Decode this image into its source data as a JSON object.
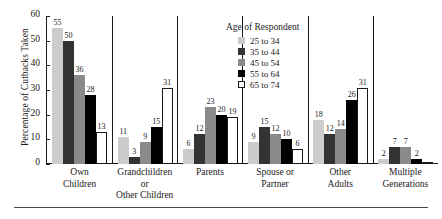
{
  "chart_data": {
    "type": "bar",
    "title": "",
    "subtitle": "",
    "xlabel": "",
    "ylabel": "Percentage of Cutbacks Taken",
    "ylim": [
      0,
      60
    ],
    "yticks": [
      0,
      10,
      20,
      30,
      40,
      50,
      60
    ],
    "grid": false,
    "legend_position": "upper-center",
    "legend_title": "Age of Respondent",
    "categories": [
      "Own Children",
      "Grandchildren or Other Children",
      "Parents",
      "Spouse or Partner",
      "Other Adults",
      "Multiple Generations"
    ],
    "category_lines": [
      [
        "Own",
        "Children"
      ],
      [
        "Grandchildren or",
        "Other Children"
      ],
      [
        "Parents",
        ""
      ],
      [
        "Spouse or",
        "Partner"
      ],
      [
        "Other",
        "Adults"
      ],
      [
        "Multiple",
        "Generations"
      ]
    ],
    "series": [
      {
        "name": "25 to 34",
        "color": "#cccccc",
        "values": [
          55,
          11,
          6,
          9,
          18,
          2
        ]
      },
      {
        "name": "35 to 44",
        "color": "#333333",
        "values": [
          50,
          3,
          12,
          15,
          12,
          7
        ]
      },
      {
        "name": "45 to 54",
        "color": "#8a8a8a",
        "values": [
          36,
          9,
          23,
          12,
          14,
          7
        ]
      },
      {
        "name": "55 to 64",
        "color": "#000000",
        "values": [
          28,
          15,
          20,
          10,
          26,
          2
        ]
      },
      {
        "name": "65 to 74",
        "color": "#ffffff",
        "values": [
          13,
          31,
          19,
          6,
          31,
          0
        ]
      }
    ],
    "bar_labels": [
      [
        "55",
        "50",
        "36",
        "28",
        "13"
      ],
      [
        "11",
        "3",
        "9",
        "15",
        "31"
      ],
      [
        "6",
        "12",
        "23",
        "20",
        "19"
      ],
      [
        "9",
        "15",
        "12",
        "10",
        "6"
      ],
      [
        "18",
        "12",
        "14",
        "26",
        "31"
      ],
      [
        "2",
        "7",
        "7",
        "2",
        ""
      ]
    ]
  },
  "axis": {
    "y_title": "Percentage of Cutbacks Taken",
    "y_ticks": [
      "0",
      "10",
      "20",
      "30",
      "40",
      "50",
      "60"
    ]
  },
  "legend": {
    "title": "Age of Respondent",
    "items": [
      {
        "label": "25 to 34"
      },
      {
        "label": "35 to 44"
      },
      {
        "label": "45 to 54"
      },
      {
        "label": "55 to 64"
      },
      {
        "label": "65 to 74"
      }
    ]
  }
}
